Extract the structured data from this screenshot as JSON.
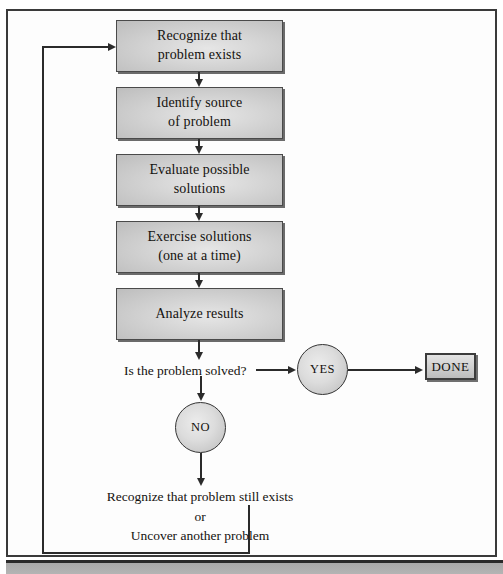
{
  "diagram": {
    "colors": {
      "box_fill": "#d6d6d6",
      "box_border": "#4a4a4a",
      "line": "#2b2b2b",
      "frame": "#3a3a3a",
      "page": "#ffffff"
    },
    "process_steps": [
      {
        "id": "recognize",
        "line1": "Recognize that",
        "line2": "problem exists"
      },
      {
        "id": "identify",
        "line1": "Identify source",
        "line2": "of problem"
      },
      {
        "id": "evaluate",
        "line1": "Evaluate possible",
        "line2": "solutions"
      },
      {
        "id": "exercise",
        "line1": "Exercise solutions",
        "line2": "(one at a time)"
      },
      {
        "id": "analyze",
        "line1": "Analyze results",
        "line2": ""
      }
    ],
    "decision_label": "Is the problem solved?",
    "yes_node": "YES",
    "no_node": "NO",
    "terminal": "DONE",
    "loopback": {
      "line1": "Recognize that problem still exists",
      "line2": "or",
      "line3": "Uncover another problem"
    }
  }
}
